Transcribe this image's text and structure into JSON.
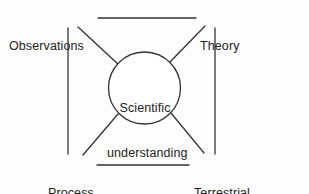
{
  "diagram": {
    "type": "cycle-diagram",
    "background_color": "#fefefe",
    "stroke_color": "#333333",
    "text_color": "#222222",
    "center_node": {
      "name": "scientific-understanding",
      "line1": "Scientific",
      "line2": "understanding",
      "shape": "circle"
    },
    "corner_nodes": [
      {
        "name": "observations",
        "position": "top-left",
        "line1": "Observations",
        "line2": ""
      },
      {
        "name": "theory",
        "position": "top-right",
        "line1": "Theory",
        "line2": ""
      },
      {
        "name": "process-parameterizations",
        "position": "bottom-left",
        "line1": "Process",
        "line2": "parameterizations"
      },
      {
        "name": "terrestrial-biosphere-models",
        "position": "bottom-right",
        "line1": "Terrestrial",
        "line2": "biosphere models"
      }
    ],
    "connectors": [
      {
        "name": "top-horizontal-connector",
        "from": "observations",
        "to": "theory"
      },
      {
        "name": "bottom-horizontal-connector",
        "from": "process-parameterizations",
        "to": "terrestrial-biosphere-models"
      },
      {
        "name": "left-vertical-connector",
        "from": "observations",
        "to": "process-parameterizations"
      },
      {
        "name": "right-vertical-connector",
        "from": "theory",
        "to": "terrestrial-biosphere-models"
      },
      {
        "name": "diagonal-observations-to-center",
        "from": "observations",
        "to": "scientific-understanding"
      },
      {
        "name": "diagonal-theory-to-center",
        "from": "theory",
        "to": "scientific-understanding"
      },
      {
        "name": "diagonal-process-to-center",
        "from": "process-parameterizations",
        "to": "scientific-understanding"
      },
      {
        "name": "diagonal-terrestrial-to-center",
        "from": "terrestrial-biosphere-models",
        "to": "scientific-understanding"
      }
    ]
  }
}
